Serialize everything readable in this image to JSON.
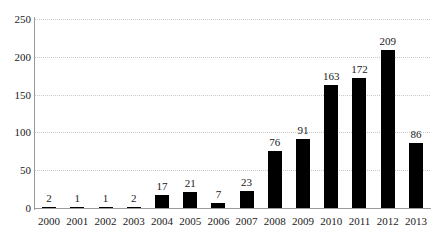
{
  "chart_data": {
    "type": "bar",
    "title": "",
    "subtitle": "",
    "xlabel": "",
    "ylabel": "",
    "categories": [
      "2000",
      "2001",
      "2002",
      "2003",
      "2004",
      "2005",
      "2006",
      "2007",
      "2008",
      "2009",
      "2010",
      "2011",
      "2012",
      "2013"
    ],
    "values": [
      2,
      1,
      1,
      2,
      17,
      21,
      7,
      23,
      76,
      91,
      163,
      172,
      209,
      86
    ],
    "value_labels": [
      "2",
      "1",
      "1",
      "2",
      "17",
      "21",
      "7",
      "23",
      "76",
      "91",
      "163",
      "172",
      "209",
      "86"
    ],
    "ylim": [
      0,
      250
    ],
    "y_ticks": [
      0,
      50,
      100,
      150,
      200,
      250
    ],
    "y_tick_labels": [
      "0",
      "50",
      "100",
      "150",
      "200",
      "250"
    ],
    "grid": true,
    "grid_style": "dotted",
    "grid_axis": "y",
    "legend": false,
    "legend_position": "none",
    "bar_color": "#000000",
    "grid_color": "#c9c9c9",
    "axis_color": "#9a9a9a",
    "text_color": "#1a1a1a",
    "background_color": "#ffffff",
    "data_labels_shown": true
  }
}
